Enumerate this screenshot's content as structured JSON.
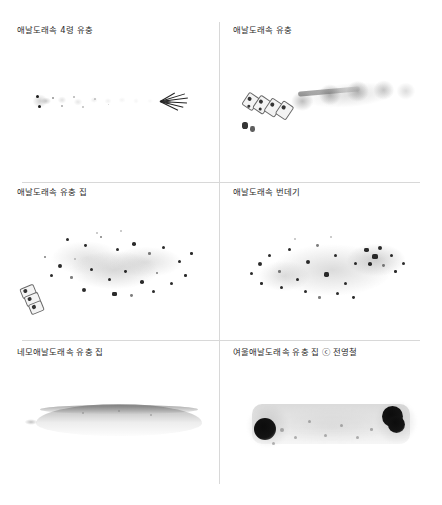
{
  "figure": {
    "background_color": "#ffffff",
    "divider_color": "#d8d8d8",
    "caption_color": "#2b2b2b",
    "columns": 2,
    "rows": 3
  },
  "panels": [
    {
      "id": "panel-1",
      "caption": "애날도래속 4령 유충",
      "subject": "fourth-instar-larva",
      "row": 1,
      "column": 1
    },
    {
      "id": "panel-2",
      "caption": "애날도래속 유충",
      "subject": "larva",
      "row": 1,
      "column": 2
    },
    {
      "id": "panel-3",
      "caption": "애날도래속 유충 집",
      "subject": "larval-case",
      "row": 2,
      "column": 1
    },
    {
      "id": "panel-4",
      "caption": "애날도래속 번데기",
      "subject": "pupa",
      "row": 2,
      "column": 2
    },
    {
      "id": "panel-5",
      "caption": "네모애날도래속 유충 집",
      "subject": "larval-case-lens",
      "row": 3,
      "column": 1
    },
    {
      "id": "panel-6",
      "caption": "여울애날도래속 유충 집 ⓒ 전영철",
      "subject": "larval-case-riffle",
      "credit_symbol": "ⓒ",
      "credit_name": "전영철",
      "row": 3,
      "column": 2
    }
  ]
}
